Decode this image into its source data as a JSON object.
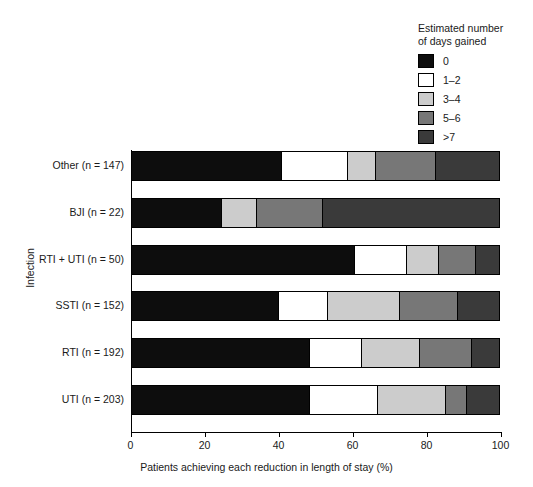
{
  "legend": {
    "title": "Estimated number\nof days gained",
    "entries": [
      {
        "label": "0",
        "color": "#0d0d0d"
      },
      {
        "label": "1–2",
        "color": "#ffffff"
      },
      {
        "label": "3–4",
        "color": "#cccccc"
      },
      {
        "label": "5–6",
        "color": "#777777"
      },
      {
        "label": ">7",
        "color": "#3a3a3a"
      }
    ]
  },
  "axes": {
    "x_title": "Patients achieving each reduction in length of stay (%)",
    "y_title": "Infection",
    "x_ticks": [
      "0",
      "20",
      "40",
      "60",
      "80",
      "100"
    ]
  },
  "chart_data": {
    "type": "bar",
    "orientation": "horizontal",
    "stacked": true,
    "title": "",
    "xlabel": "Patients achieving each reduction in length of stay (%)",
    "ylabel": "Infection",
    "xlim": [
      0,
      100
    ],
    "xticks": [
      0,
      20,
      40,
      60,
      80,
      100
    ],
    "grid": false,
    "legend_title": "Estimated number of days gained",
    "legend_position": "top-right",
    "categories": [
      "Other (n = 147)",
      "BJI (n = 22)",
      "RTI + UTI  (n = 50)",
      "SSTI (n = 152)",
      "RTI (n = 192)",
      "UTI (n = 203)"
    ],
    "series": [
      {
        "name": "0",
        "color": "#0d0d0d",
        "values": [
          41.0,
          24.7,
          60.8,
          40.1,
          48.6,
          48.6
        ]
      },
      {
        "name": "1–2",
        "color": "#ffffff",
        "values": [
          17.7,
          0.0,
          13.8,
          13.4,
          14.1,
          18.4
        ]
      },
      {
        "name": "3–4",
        "color": "#cccccc",
        "values": [
          7.7,
          9.4,
          8.7,
          19.3,
          15.5,
          18.3
        ]
      },
      {
        "name": "5–6",
        "color": "#777777",
        "values": [
          16.2,
          18.0,
          10.2,
          15.8,
          14.0,
          5.7
        ]
      },
      {
        "name": ">7",
        "color": "#3a3a3a",
        "values": [
          17.4,
          47.9,
          6.5,
          11.4,
          7.8,
          9.0
        ]
      }
    ]
  }
}
